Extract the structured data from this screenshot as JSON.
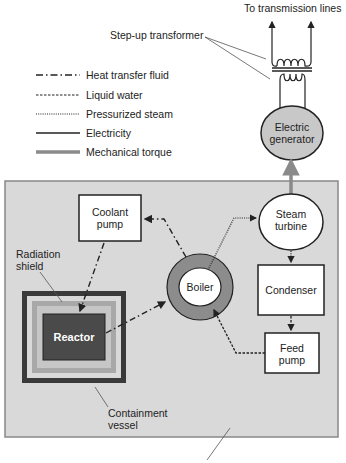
{
  "diagram": {
    "type": "nuclear power plant schematic",
    "labels": {
      "transmission": "To transmission lines",
      "transformer": "Step-up transformer",
      "generator_line1": "Electric",
      "generator_line2": "generator",
      "turbine_line1": "Steam",
      "turbine_line2": "turbine",
      "condenser": "Condenser",
      "feed_pump_line1": "Feed",
      "feed_pump_line2": "pump",
      "coolant_pump_line1": "Coolant",
      "coolant_pump_line2": "pump",
      "boiler": "Boiler",
      "reactor": "Reactor",
      "shield_line1": "Radiation",
      "shield_line2": "shield",
      "containment_line1": "Containment",
      "containment_line2": "vessel"
    },
    "legend": [
      {
        "style": "dash-dot",
        "label": "Heat transfer fluid"
      },
      {
        "style": "dashed",
        "label": "Liquid water"
      },
      {
        "style": "dotted",
        "label": "Pressurized steam"
      },
      {
        "style": "solid",
        "label": "Electricity"
      },
      {
        "style": "thick-gray",
        "label": "Mechanical torque"
      }
    ],
    "colors": {
      "background_panel": "#d9d9d9",
      "reactor": "#4a4a4a",
      "containment": "#3a3a3a",
      "shield_outer": "#a8a8a8",
      "shield_inner": "#c6c6c6",
      "boiler_ring": "#8c8c8c",
      "generator": "#c8c8c8",
      "torque": "#8a8a8a",
      "lines": "#222222"
    }
  }
}
